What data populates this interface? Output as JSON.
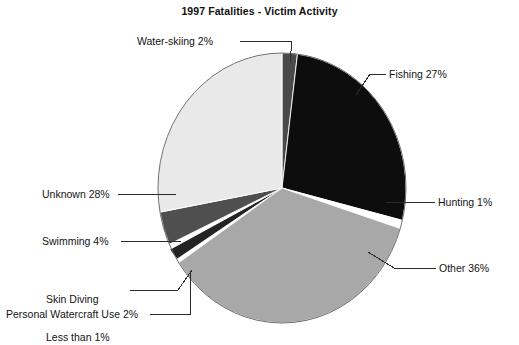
{
  "chart_data": {
    "type": "pie",
    "title": "1997 Fatalities - Victim Activity",
    "xlabel": "",
    "ylabel": "",
    "legend": "none",
    "grid": false,
    "start_angle_deg": -90,
    "direction": "clockwise",
    "categories": [
      "Water-skiing",
      "Fishing",
      "Hunting",
      "Other",
      "Personal Watercraft Use",
      "Skin Diving",
      "Swimming",
      "Unknown"
    ],
    "values": [
      2,
      27,
      1,
      36,
      2,
      0.5,
      4,
      28
    ],
    "labels": [
      "Water-skiing 2%",
      "Fishing 27%",
      "Hunting 1%",
      "Other 36%",
      "Personal Watercraft Use 2%",
      "Skin Diving\nLess than 1%",
      "Swimming 4%",
      "Unknown 28%"
    ],
    "colors": [
      "#4a4a4a",
      "#0d0d0d",
      "#ffffff",
      "#a8a8a8",
      "#242424",
      "#ffffff",
      "#4f4f4f",
      "#e9e9e9"
    ],
    "slices": [
      {
        "name": "Water-skiing",
        "value": 2,
        "value_text": "2%",
        "label": "Water-skiing 2%",
        "color": "#4a4a4a"
      },
      {
        "name": "Fishing",
        "value": 27,
        "value_text": "27%",
        "label": "Fishing 27%",
        "color": "#0d0d0d"
      },
      {
        "name": "Hunting",
        "value": 1,
        "value_text": "1%",
        "label": "Hunting 1%",
        "color": "#ffffff"
      },
      {
        "name": "Other",
        "value": 36,
        "value_text": "36%",
        "label": "Other 36%",
        "color": "#a8a8a8"
      },
      {
        "name": "Personal Watercraft Use",
        "value": 2,
        "value_text": "2%",
        "label": "Personal Watercraft Use 2%",
        "color": "#242424"
      },
      {
        "name": "Skin Diving",
        "value": 0.5,
        "value_text": "Less than 1%",
        "label": "Skin Diving Less than 1%",
        "color": "#ffffff"
      },
      {
        "name": "Swimming",
        "value": 4,
        "value_text": "4%",
        "label": "Swimming 4%",
        "color": "#4f4f4f"
      },
      {
        "name": "Unknown",
        "value": 28,
        "value_text": "28%",
        "label": "Unknown 28%",
        "color": "#e9e9e9"
      }
    ]
  },
  "labels": {
    "water_skiing": "Water-skiing 2%",
    "fishing": "Fishing 27%",
    "hunting": "Hunting 1%",
    "other": "Other 36%",
    "unknown": "Unknown 28%",
    "swimming": "Swimming 4%",
    "skin_diving_line1": "Skin Diving",
    "skin_diving_line2": "Less than 1%",
    "personal_watercraft": "Personal Watercraft Use 2%"
  }
}
